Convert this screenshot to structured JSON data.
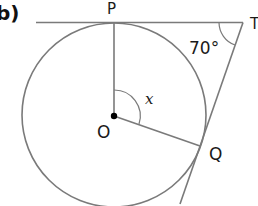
{
  "part_label": "b)",
  "points": {
    "P": "P",
    "T": "T",
    "O": "O",
    "Q": "Q"
  },
  "angles": {
    "at_T": "70°",
    "at_O": "x"
  },
  "colors": {
    "line": "#7a7a7a",
    "text": "#1a1a1a",
    "center_dot": "#000000"
  }
}
